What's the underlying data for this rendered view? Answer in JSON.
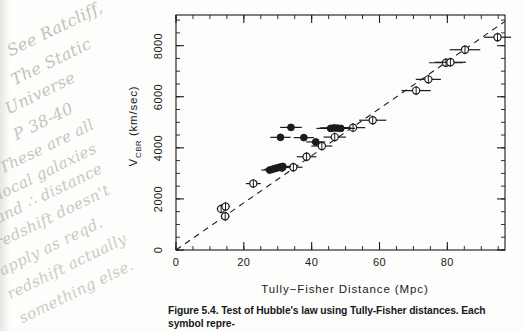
{
  "figure": {
    "caption_label": "Figure 5.4.",
    "caption_text": " Test of Hubble's law using Tully-Fisher distances. Each symbol repre-"
  },
  "handwritten_notes": [
    {
      "text": "See Ratcliff,",
      "left": 14,
      "top": 28,
      "rotate": -26,
      "size": 16
    },
    {
      "text": "The Static",
      "left": 18,
      "top": 57,
      "rotate": -26,
      "size": 16
    },
    {
      "text": "Universe",
      "left": 12,
      "top": 86,
      "rotate": -26,
      "size": 16
    },
    {
      "text": "P 38-40",
      "left": 20,
      "top": 112,
      "rotate": -26,
      "size": 16
    },
    {
      "text": "These are all",
      "left": 6,
      "top": 146,
      "rotate": -26,
      "size": 15
    },
    {
      "text": "local galaxies",
      "left": 4,
      "top": 172,
      "rotate": -26,
      "size": 15
    },
    {
      "text": "and ∴ distance",
      "left": 2,
      "top": 196,
      "rotate": -26,
      "size": 15
    },
    {
      "text": "redshift doesn't",
      "left": 2,
      "top": 221,
      "rotate": -26,
      "size": 15
    },
    {
      "text": "apply as reqd.",
      "left": 6,
      "top": 248,
      "rotate": -26,
      "size": 15
    },
    {
      "text": "redshift actually",
      "left": 14,
      "top": 272,
      "rotate": -26,
      "size": 15
    },
    {
      "text": "something else.",
      "left": 26,
      "top": 296,
      "rotate": -26,
      "size": 15
    }
  ],
  "chart_data": {
    "type": "scatter",
    "title": "",
    "xlabel": "Tully−Fisher Distance (Mpc)",
    "ylabel": "V_CBR (km/sec)",
    "ylabel_base": "V",
    "ylabel_sub": "CBR",
    "ylabel_unit": " (km/sec)",
    "xlim": [
      0,
      97
    ],
    "ylim": [
      0,
      9200
    ],
    "xticks": [
      0,
      20,
      40,
      60,
      80
    ],
    "yticks": [
      0,
      2000,
      4000,
      6000,
      8000
    ],
    "xtick_labels": [
      "0",
      "20",
      "40",
      "60",
      "80"
    ],
    "ytick_labels": [
      "0",
      "2000",
      "4000",
      "6000",
      "8000"
    ],
    "x_minor_step": 5,
    "y_minor_step": 500,
    "grid": false,
    "legend": null,
    "fit_line": {
      "label": "Hubble law fit (dashed)",
      "style": "dashed",
      "x0": 0,
      "y0": 0,
      "x1": 97,
      "y1": 8950
    },
    "series": [
      {
        "name": "open circles",
        "marker": "open-circle",
        "points": [
          {
            "x": 13.3,
            "y": 1610,
            "xerr": 1.3
          },
          {
            "x": 14.6,
            "y": 1700,
            "xerr": 1.3
          },
          {
            "x": 14.5,
            "y": 1320,
            "xerr": 1.3
          },
          {
            "x": 22.8,
            "y": 2600,
            "xerr": 2.2
          },
          {
            "x": 31.3,
            "y": 3230,
            "xerr": 2.6
          },
          {
            "x": 34.6,
            "y": 3240,
            "xerr": 2.7
          },
          {
            "x": 38.5,
            "y": 3650,
            "xerr": 2.9
          },
          {
            "x": 43.0,
            "y": 4070,
            "xerr": 3.1
          },
          {
            "x": 46.8,
            "y": 4420,
            "xerr": 3.3
          },
          {
            "x": 52.2,
            "y": 4790,
            "xerr": 3.6
          },
          {
            "x": 58.0,
            "y": 5080,
            "xerr": 4.0
          },
          {
            "x": 70.8,
            "y": 6240,
            "xerr": 4.3
          },
          {
            "x": 74.4,
            "y": 6680,
            "xerr": 3.7
          },
          {
            "x": 79.6,
            "y": 7330,
            "xerr": 5.0
          },
          {
            "x": 80.9,
            "y": 7350,
            "xerr": 4.6
          },
          {
            "x": 85.2,
            "y": 7840,
            "xerr": 4.5
          },
          {
            "x": 94.8,
            "y": 8330,
            "xerr": 4.0
          }
        ]
      },
      {
        "name": "filled circles",
        "marker": "filled-circle",
        "points": [
          {
            "x": 27.6,
            "y": 3130,
            "xerr": 2.4
          },
          {
            "x": 28.4,
            "y": 3160,
            "xerr": 2.4
          },
          {
            "x": 29.2,
            "y": 3190,
            "xerr": 2.4
          },
          {
            "x": 30.0,
            "y": 3220,
            "xerr": 2.4
          },
          {
            "x": 30.8,
            "y": 3250,
            "xerr": 2.4
          },
          {
            "x": 31.5,
            "y": 3270,
            "xerr": 2.4
          },
          {
            "x": 30.8,
            "y": 4410,
            "xerr": 3.0
          },
          {
            "x": 33.9,
            "y": 4800,
            "xerr": 3.2
          },
          {
            "x": 37.7,
            "y": 4400,
            "xerr": 3.0
          },
          {
            "x": 41.2,
            "y": 4230,
            "xerr": 2.8
          },
          {
            "x": 45.6,
            "y": 4760,
            "xerr": 4.2
          },
          {
            "x": 46.6,
            "y": 4780,
            "xerr": 4.2
          },
          {
            "x": 47.6,
            "y": 4770,
            "xerr": 4.2
          },
          {
            "x": 48.6,
            "y": 4760,
            "xerr": 4.2
          }
        ]
      }
    ]
  }
}
